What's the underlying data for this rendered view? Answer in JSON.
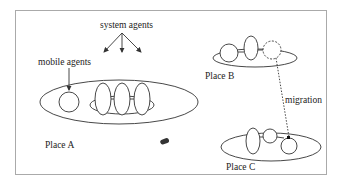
{
  "diagram": {
    "labels": {
      "system_agents": "system agents",
      "mobile_agents": "mobile agents",
      "place_a": "Place A",
      "place_b": "Place B",
      "place_c": "Place C",
      "migration": "migration"
    },
    "colors": {
      "stroke": "#333333",
      "frame": "#aaaaaa",
      "background": "#ffffff"
    }
  }
}
